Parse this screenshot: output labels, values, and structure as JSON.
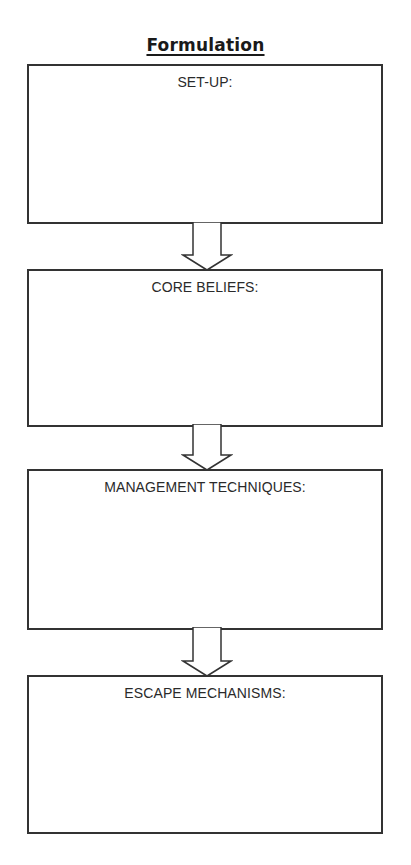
{
  "title": "Formulation",
  "boxes": [
    {
      "label": "SET-UP:",
      "content": ""
    },
    {
      "label": "CORE BELIEFS:",
      "content": ""
    },
    {
      "label": "MANAGEMENT TECHNIQUES:",
      "content": ""
    },
    {
      "label": "ESCAPE MECHANISMS:",
      "content": ""
    }
  ],
  "arrows": [
    {
      "from": "SET-UP:",
      "to": "CORE BELIEFS:",
      "style": "hollow-down-arrow"
    },
    {
      "from": "CORE BELIEFS:",
      "to": "MANAGEMENT TECHNIQUES:",
      "style": "hollow-down-arrow"
    },
    {
      "from": "MANAGEMENT TECHNIQUES:",
      "to": "ESCAPE MECHANISMS:",
      "style": "hollow-down-arrow"
    }
  ],
  "colors": {
    "border": "#333333",
    "text": "#2a2a2a",
    "background": "#ffffff"
  }
}
